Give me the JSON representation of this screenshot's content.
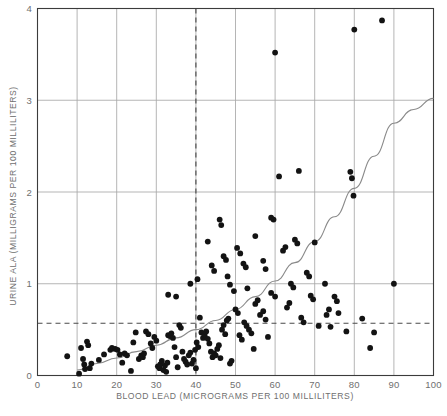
{
  "chart_data": {
    "type": "scatter",
    "title": "",
    "xlabel": "BLOOD LEAD (MICROGRAMS PER 100 MILLILITERS)",
    "ylabel": "URINE ALA (MILLIGRAMS PER 100 MILLILITERS)",
    "xlim": [
      0,
      100
    ],
    "ylim": [
      0,
      4
    ],
    "xticks": [
      0,
      10,
      20,
      30,
      40,
      50,
      60,
      70,
      80,
      90,
      100
    ],
    "xtick_labels": [
      "0",
      "10",
      "20",
      "30",
      "40",
      "50",
      "60",
      "70",
      "80",
      "90",
      "100"
    ],
    "yticks": [
      0,
      1,
      2,
      3,
      4
    ],
    "ytick_labels": [
      "0",
      "1",
      "2",
      "3",
      "4"
    ],
    "grid": "both",
    "legend": "none",
    "marker_color": "#131313",
    "curve_color": "#8a8a8a",
    "grid_color": "#a8a8a8",
    "frame_color": "#3b3b3b",
    "reference_lines": [
      {
        "name": "blood-lead-threshold",
        "orientation": "vertical",
        "value": 40,
        "style": "dashed"
      },
      {
        "name": "urine-ala-threshold",
        "orientation": "horizontal",
        "value": 0.57,
        "style": "dashed"
      }
    ],
    "fit_curve": {
      "name": "exponential-trend",
      "description": "monotonic increasing curve through the data",
      "points": [
        [
          10,
          0.06
        ],
        [
          15,
          0.13
        ],
        [
          20,
          0.19
        ],
        [
          25,
          0.26
        ],
        [
          30,
          0.33
        ],
        [
          35,
          0.41
        ],
        [
          40,
          0.5
        ],
        [
          45,
          0.6
        ],
        [
          50,
          0.72
        ],
        [
          55,
          0.86
        ],
        [
          60,
          1.03
        ],
        [
          65,
          1.23
        ],
        [
          70,
          1.46
        ],
        [
          75,
          1.73
        ],
        [
          80,
          2.04
        ],
        [
          85,
          2.39
        ],
        [
          90,
          2.75
        ],
        [
          95,
          2.9
        ],
        [
          100,
          3.02
        ]
      ]
    },
    "points": [
      [
        7.5,
        0.21
      ],
      [
        10.5,
        0.02
      ],
      [
        11.0,
        0.3
      ],
      [
        11.5,
        0.18
      ],
      [
        11.8,
        0.12
      ],
      [
        12.0,
        0.07
      ],
      [
        12.5,
        0.37
      ],
      [
        12.8,
        0.33
      ],
      [
        13.2,
        0.08
      ],
      [
        13.6,
        0.13
      ],
      [
        15.5,
        0.17
      ],
      [
        16.8,
        0.23
      ],
      [
        18.4,
        0.28
      ],
      [
        18.8,
        0.3
      ],
      [
        19.6,
        0.29
      ],
      [
        20.2,
        0.28
      ],
      [
        20.8,
        0.23
      ],
      [
        21.4,
        0.14
      ],
      [
        22.0,
        0.24
      ],
      [
        22.6,
        0.22
      ],
      [
        23.6,
        0.05
      ],
      [
        24.2,
        0.36
      ],
      [
        24.8,
        0.47
      ],
      [
        25.6,
        0.18
      ],
      [
        26.2,
        0.22
      ],
      [
        26.6,
        0.2
      ],
      [
        26.9,
        0.24
      ],
      [
        27.4,
        0.48
      ],
      [
        28.0,
        0.45
      ],
      [
        28.6,
        0.35
      ],
      [
        29.0,
        0.3
      ],
      [
        29.5,
        0.42
      ],
      [
        30.0,
        0.38
      ],
      [
        30.4,
        0.1
      ],
      [
        30.8,
        0.08
      ],
      [
        31.0,
        0.12
      ],
      [
        31.4,
        0.16
      ],
      [
        31.8,
        0.06
      ],
      [
        32.2,
        0.11
      ],
      [
        32.5,
        0.04
      ],
      [
        32.8,
        0.14
      ],
      [
        33.0,
        0.44
      ],
      [
        33.4,
        0.43
      ],
      [
        33.8,
        0.46
      ],
      [
        34.2,
        0.41
      ],
      [
        34.6,
        0.31
      ],
      [
        35.0,
        0.2
      ],
      [
        35.4,
        0.09
      ],
      [
        35.8,
        0.55
      ],
      [
        36.2,
        0.52
      ],
      [
        36.6,
        0.26
      ],
      [
        37.0,
        0.18
      ],
      [
        37.4,
        0.15
      ],
      [
        37.8,
        0.12
      ],
      [
        38.2,
        0.22
      ],
      [
        38.6,
        0.25
      ],
      [
        39.0,
        0.13
      ],
      [
        39.4,
        0.17
      ],
      [
        39.8,
        0.28
      ],
      [
        40.0,
        0.08
      ],
      [
        40.2,
        0.36
      ],
      [
        40.6,
        0.31
      ],
      [
        41.0,
        0.63
      ],
      [
        41.4,
        0.47
      ],
      [
        41.8,
        0.41
      ],
      [
        42.2,
        0.44
      ],
      [
        42.6,
        0.48
      ],
      [
        43.0,
        0.4
      ],
      [
        43.4,
        0.35
      ],
      [
        43.8,
        0.26
      ],
      [
        44.2,
        0.2
      ],
      [
        44.6,
        0.24
      ],
      [
        45.0,
        0.22
      ],
      [
        45.4,
        0.29
      ],
      [
        45.8,
        0.33
      ],
      [
        46.2,
        0.19
      ],
      [
        46.6,
        0.5
      ],
      [
        47.0,
        0.55
      ],
      [
        47.4,
        0.45
      ],
      [
        47.8,
        0.6
      ],
      [
        48.2,
        0.62
      ],
      [
        48.6,
        0.13
      ],
      [
        49.0,
        0.16
      ],
      [
        50.0,
        0.72
      ],
      [
        50.6,
        0.68
      ],
      [
        51.0,
        0.44
      ],
      [
        51.6,
        0.39
      ],
      [
        52.2,
        0.58
      ],
      [
        52.8,
        0.54
      ],
      [
        53.4,
        0.5
      ],
      [
        54.0,
        0.46
      ],
      [
        54.6,
        0.29
      ],
      [
        55.0,
        0.78
      ],
      [
        55.6,
        0.82
      ],
      [
        56.2,
        0.66
      ],
      [
        57.0,
        0.7
      ],
      [
        57.6,
        0.61
      ],
      [
        58.2,
        0.42
      ],
      [
        59.0,
        0.9
      ],
      [
        60.0,
        0.86
      ],
      [
        33.0,
        0.88
      ],
      [
        35.0,
        0.86
      ],
      [
        38.6,
        1.0
      ],
      [
        40.4,
        1.05
      ],
      [
        43.0,
        1.46
      ],
      [
        44.0,
        1.2
      ],
      [
        44.6,
        1.14
      ],
      [
        46.0,
        1.7
      ],
      [
        46.4,
        1.64
      ],
      [
        47.0,
        1.3
      ],
      [
        47.6,
        1.26
      ],
      [
        48.0,
        1.08
      ],
      [
        48.6,
        0.99
      ],
      [
        49.6,
        0.92
      ],
      [
        50.4,
        1.39
      ],
      [
        51.2,
        1.33
      ],
      [
        52.0,
        1.22
      ],
      [
        52.6,
        1.18
      ],
      [
        53.0,
        0.95
      ],
      [
        55.0,
        1.52
      ],
      [
        57.0,
        1.25
      ],
      [
        57.6,
        1.16
      ],
      [
        59.0,
        1.72
      ],
      [
        59.6,
        1.7
      ],
      [
        60.0,
        3.52
      ],
      [
        61.0,
        2.17
      ],
      [
        62.0,
        1.36
      ],
      [
        62.6,
        1.4
      ],
      [
        63.0,
        0.74
      ],
      [
        63.6,
        0.79
      ],
      [
        64.0,
        1.0
      ],
      [
        64.6,
        0.96
      ],
      [
        65.0,
        1.48
      ],
      [
        65.6,
        1.44
      ],
      [
        66.0,
        2.23
      ],
      [
        66.6,
        0.63
      ],
      [
        67.2,
        0.58
      ],
      [
        68.0,
        1.12
      ],
      [
        68.6,
        1.08
      ],
      [
        69.0,
        0.87
      ],
      [
        69.6,
        0.83
      ],
      [
        70.0,
        1.45
      ],
      [
        71.0,
        0.54
      ],
      [
        72.6,
        1.0
      ],
      [
        73.0,
        0.66
      ],
      [
        73.6,
        0.72
      ],
      [
        74.0,
        0.53
      ],
      [
        75.0,
        0.86
      ],
      [
        75.6,
        0.81
      ],
      [
        76.0,
        0.68
      ],
      [
        78.0,
        0.48
      ],
      [
        79.0,
        2.22
      ],
      [
        79.4,
        2.15
      ],
      [
        79.8,
        1.96
      ],
      [
        80.0,
        3.77
      ],
      [
        82.0,
        0.62
      ],
      [
        84.0,
        0.3
      ],
      [
        85.0,
        0.47
      ],
      [
        87.0,
        3.87
      ],
      [
        90.0,
        1.0
      ]
    ]
  }
}
